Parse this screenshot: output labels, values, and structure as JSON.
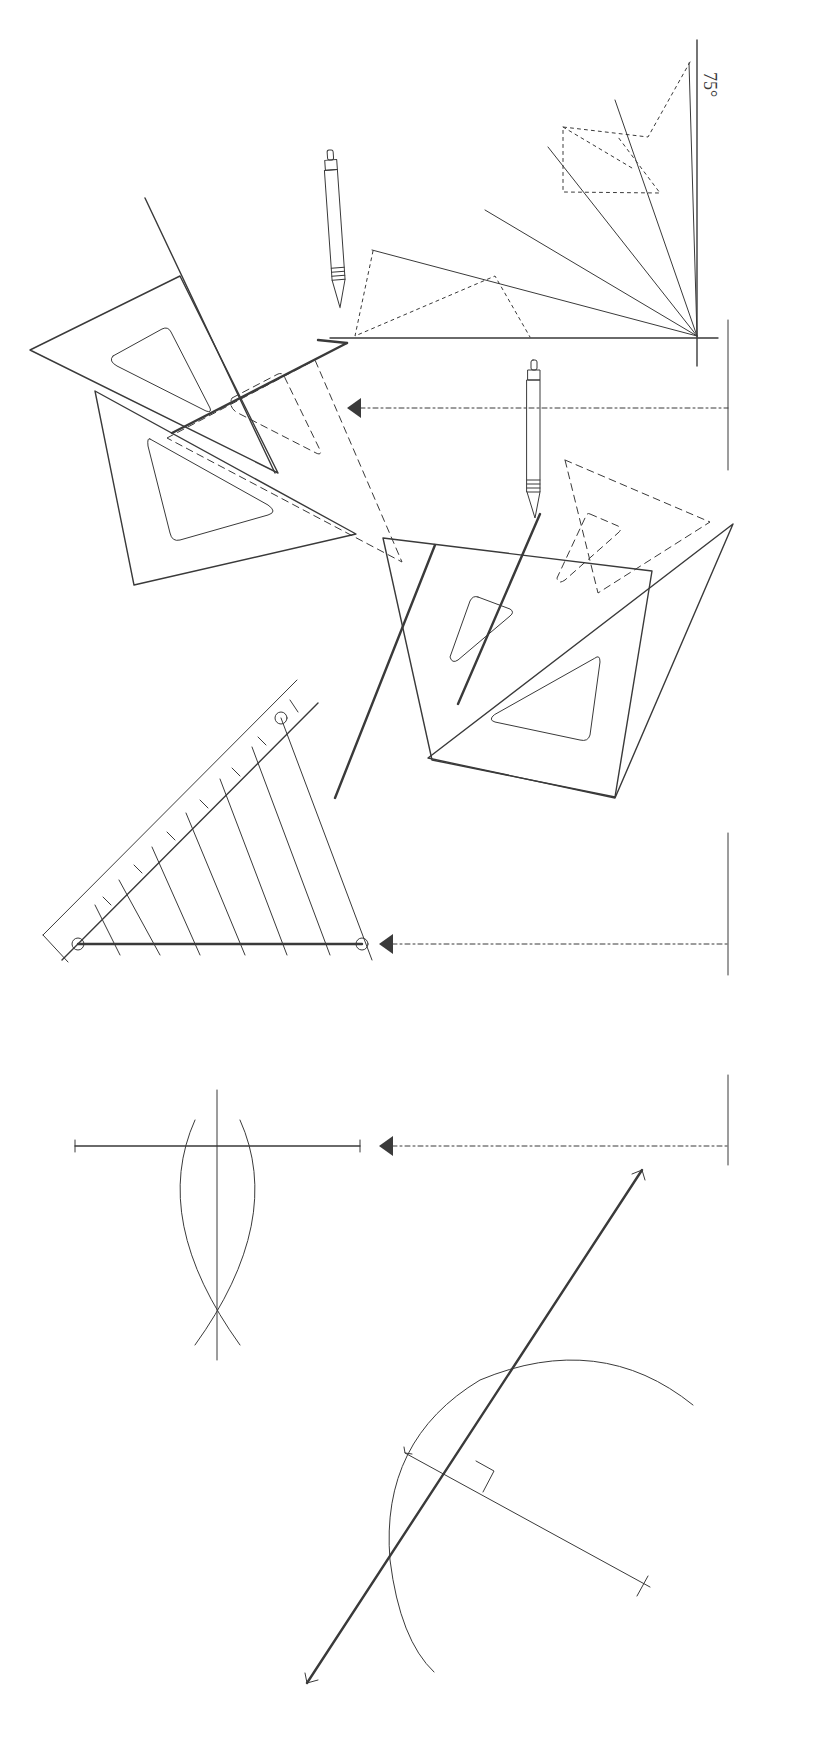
{
  "figure": {
    "ink_color": "#3a3a3a",
    "background": "#ffffff"
  },
  "angle_construction": {
    "label": "75°",
    "vertex": [
      697,
      336
    ],
    "rays": [
      [
        [
          697,
          336
        ],
        [
          372,
          250
        ]
      ],
      [
        [
          697,
          336
        ],
        [
          485,
          210
        ]
      ],
      [
        [
          697,
          336
        ],
        [
          548,
          147
        ]
      ],
      [
        [
          697,
          336
        ],
        [
          615,
          100
        ]
      ],
      [
        [
          697,
          336
        ],
        [
          689,
          63
        ]
      ]
    ]
  },
  "set_squares": {
    "upper_pair_pencil_label": "pencil",
    "lower_pair_pencil_label": "pencil"
  },
  "arrows": [
    {
      "y": 408,
      "from_x": 728,
      "to_x": 350
    },
    {
      "y": 944,
      "from_x": 728,
      "to_x": 383
    },
    {
      "y": 1146,
      "from_x": 728,
      "to_x": 383
    }
  ],
  "divided_line": {
    "start": [
      78,
      944
    ],
    "end": [
      362,
      944
    ],
    "divisions": 7
  },
  "bisector": {
    "horizontal": [
      [
        75,
        1146
      ],
      [
        360,
        1146
      ]
    ],
    "vertical": [
      [
        217,
        1090
      ],
      [
        217,
        1360
      ]
    ]
  },
  "tangent": {
    "line": [
      [
        307,
        1683
      ],
      [
        642,
        1170
      ]
    ],
    "circle_center": [
      650,
      1585
    ]
  }
}
